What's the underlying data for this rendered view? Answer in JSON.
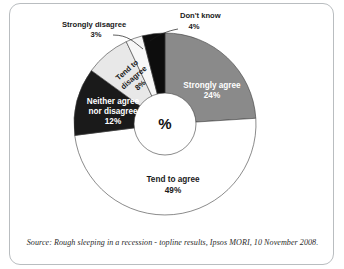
{
  "chart_data": {
    "type": "pie",
    "variant": "donut",
    "title": "",
    "subtitle": "",
    "xlabel": "",
    "ylabel": "",
    "center_label": "%",
    "units": "percent",
    "legend_position": "none",
    "grid": false,
    "categories": [
      "Strongly agree",
      "Tend to agree",
      "Neither agree nor disagree",
      "Tend to disagree",
      "Strongly disagree",
      "Don't know"
    ],
    "values": [
      24,
      49,
      12,
      8,
      3,
      4
    ],
    "value_labels": [
      "24%",
      "49%",
      "12%",
      "8%",
      "3%",
      "4%"
    ],
    "colors": [
      "#8a8a8a",
      "#ffffff",
      "#1a1a1a",
      "#e8e8e8",
      "#f7f7f7",
      "#0d0d0d"
    ],
    "slices": [
      {
        "name": "Strongly agree",
        "value": 24,
        "value_label": "24%",
        "color": "#8a8a8a",
        "text_color": "#ffffff",
        "label_style": "inside",
        "line1": "Strongly agree",
        "line2": "24%"
      },
      {
        "name": "Tend to agree",
        "value": 49,
        "value_label": "49%",
        "color": "#ffffff",
        "text_color": "#1a1a1a",
        "label_style": "inside",
        "line1": "Tend to agree",
        "line2": "49%"
      },
      {
        "name": "Neither agree nor disagree",
        "value": 12,
        "value_label": "12%",
        "color": "#1a1a1a",
        "text_color": "#ffffff",
        "label_style": "inside",
        "line1": "Neither agree",
        "line2": "nor disagree",
        "line3": "12%"
      },
      {
        "name": "Tend to disagree",
        "value": 8,
        "value_label": "8%",
        "color": "#e8e8e8",
        "text_color": "#1a1a1a",
        "label_style": "inside-rotated",
        "line1": "Tend to",
        "line2": "disagree",
        "line3": "8%"
      },
      {
        "name": "Strongly disagree",
        "value": 3,
        "value_label": "3%",
        "color": "#f7f7f7",
        "text_color": "#1a1a1a",
        "label_style": "callout",
        "line1": "Strongly disagree",
        "line2": "3%"
      },
      {
        "name": "Don't know",
        "value": 4,
        "value_label": "4%",
        "color": "#0d0d0d",
        "text_color": "#1a1a1a",
        "label_style": "callout",
        "line1": "Don't know",
        "line2": "4%"
      }
    ]
  },
  "source": {
    "note": "Source: Rough sleeping in a recession - topline results, Ipsos MORI, 10 November 2008."
  }
}
